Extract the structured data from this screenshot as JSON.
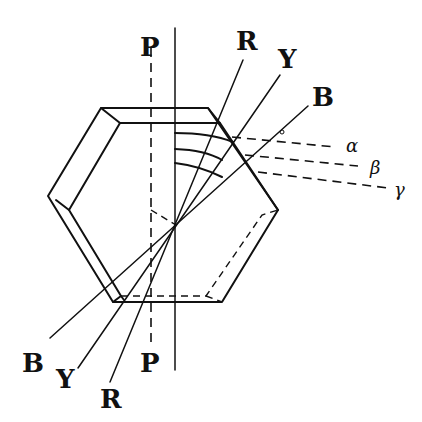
{
  "figure": {
    "labels": {
      "p_top": "P",
      "p_bottom": "P",
      "r_top": "R",
      "y_top": "Y",
      "b_top": "B",
      "r_bottom": "R",
      "y_bottom": "Y",
      "b_bottom": "B",
      "alpha": "α",
      "beta": "β",
      "gamma": "γ"
    },
    "colors": {
      "ink": "#111111",
      "background": "#ffffff"
    }
  }
}
